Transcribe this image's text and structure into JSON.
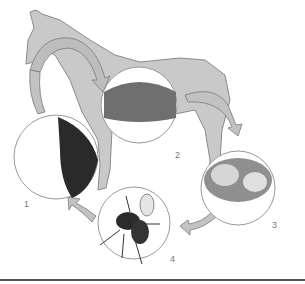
{
  "diagram": {
    "colors": {
      "horse_fill": "#c9c9c9",
      "horse_stroke": "#8a8a8a",
      "arrow_fill": "#c2c2c2",
      "circle_stroke": "#9a9a9a",
      "rule": "#555555"
    },
    "stages": [
      {
        "number": "1",
        "depiction": "eggs on horse hair"
      },
      {
        "number": "2",
        "depiction": "larvae in stomach lining"
      },
      {
        "number": "3",
        "depiction": "pupae in dung"
      },
      {
        "number": "4",
        "depiction": "adult bot fly"
      }
    ]
  }
}
